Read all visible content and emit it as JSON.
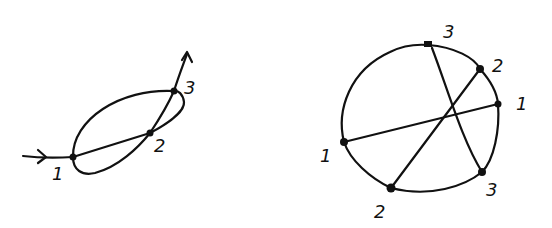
{
  "left_figure": {
    "description": "Closed curve traversed with chord, three labeled intersection points",
    "labels": {
      "p1": "1",
      "p2": "2",
      "p3": "3"
    }
  },
  "right_figure": {
    "description": "Circle with three chords connecting paired points",
    "labels": {
      "top3": "3",
      "upper2": "2",
      "right1": "1",
      "left1": "1",
      "bottom2": "2",
      "bottom3": "3"
    }
  }
}
